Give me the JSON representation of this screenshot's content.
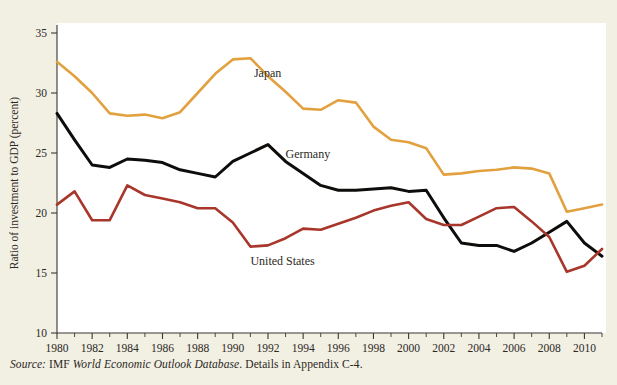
{
  "figure": {
    "cut_off_header": "",
    "source_note": {
      "label": "Source:",
      "agency": " IMF ",
      "title": "World Economic Outlook Database",
      "tail": ". Details in Appendix C-4."
    }
  },
  "chart_data": {
    "type": "line",
    "title": "",
    "xlabel": "",
    "ylabel": "Ratio of investment to GDP (percent)",
    "ylim": [
      10,
      35
    ],
    "xlim": [
      1980,
      2011
    ],
    "yticks": [
      10,
      15,
      20,
      25,
      30,
      35
    ],
    "ytick_labels": [
      "10",
      "15",
      "20",
      "25",
      "30",
      "35"
    ],
    "xticks": [
      1980,
      1982,
      1984,
      1986,
      1988,
      1990,
      1992,
      1994,
      1996,
      1998,
      2000,
      2002,
      2004,
      2006,
      2008,
      2010
    ],
    "xtick_labels": [
      "1980",
      "1982",
      "1984",
      "1986",
      "1988",
      "1990",
      "1992",
      "1994",
      "1996",
      "1998",
      "2000",
      "2002",
      "2004",
      "2006",
      "2008",
      "2010"
    ],
    "minor_xtick_step": 1,
    "grid": false,
    "legend": "inline-labels",
    "x": [
      1980,
      1981,
      1982,
      1983,
      1984,
      1985,
      1986,
      1987,
      1988,
      1989,
      1990,
      1991,
      1992,
      1993,
      1994,
      1995,
      1996,
      1997,
      1998,
      1999,
      2000,
      2001,
      2002,
      2003,
      2004,
      2005,
      2006,
      2007,
      2008,
      2009,
      2010,
      2011
    ],
    "series": [
      {
        "name": "Japan",
        "color": "#e2a13e",
        "label_x": 1991.2,
        "label_y": 31.3,
        "values": [
          32.6,
          31.4,
          30.0,
          28.3,
          28.1,
          28.2,
          27.9,
          28.4,
          30.0,
          31.6,
          32.8,
          32.9,
          31.4,
          30.1,
          28.7,
          28.6,
          29.4,
          29.2,
          27.2,
          26.1,
          25.9,
          25.4,
          23.2,
          23.3,
          23.5,
          23.6,
          23.8,
          23.7,
          23.3,
          20.1,
          20.4,
          20.7
        ]
      },
      {
        "name": "Germany",
        "color": "#0f0d0b",
        "label_x": 1993.0,
        "label_y": 24.6,
        "values": [
          28.3,
          26.1,
          24.0,
          23.8,
          24.5,
          24.4,
          24.2,
          23.6,
          23.3,
          23.0,
          24.3,
          25.0,
          25.7,
          24.3,
          23.3,
          22.3,
          21.9,
          21.9,
          22.0,
          22.1,
          21.8,
          21.9,
          19.6,
          17.5,
          17.3,
          17.3,
          16.8,
          17.5,
          18.4,
          19.3,
          17.5,
          16.4
        ]
      },
      {
        "name": "United States",
        "color": "#a8362a",
        "label_x": 1991.0,
        "label_y": 15.7,
        "values": [
          20.7,
          21.8,
          19.4,
          19.4,
          22.3,
          21.5,
          21.2,
          20.9,
          20.4,
          20.4,
          19.2,
          17.2,
          17.3,
          17.9,
          18.7,
          18.6,
          19.1,
          19.6,
          20.2,
          20.6,
          20.9,
          19.5,
          19.0,
          19.0,
          19.7,
          20.4,
          20.5,
          19.3,
          18.0,
          15.1,
          15.6,
          17.0
        ]
      }
    ]
  }
}
